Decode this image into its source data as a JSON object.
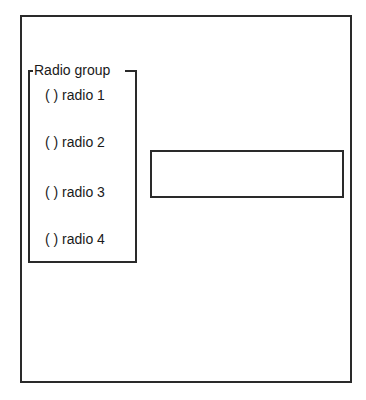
{
  "radio_group": {
    "title": "Radio group",
    "items": [
      {
        "label": "( ) radio 1"
      },
      {
        "label": "( ) radio 2"
      },
      {
        "label": "( ) radio 3"
      },
      {
        "label": "( ) radio 4"
      }
    ]
  },
  "textbox": {
    "value": ""
  }
}
